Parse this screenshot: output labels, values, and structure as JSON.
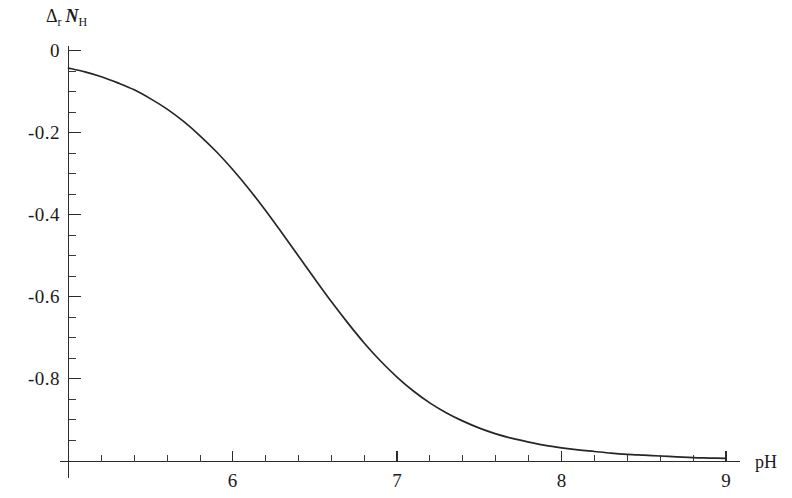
{
  "chart_data": {
    "type": "line",
    "title": "",
    "subtitle": "",
    "xlabel": "pH",
    "ylabel_parts": {
      "delta": "Δ",
      "delta_sub": "r",
      "symbol": "N",
      "symbol_sub": "H"
    },
    "ylabel": "Δr NH",
    "xlim": [
      5,
      9
    ],
    "ylim": [
      -1.0,
      0.0
    ],
    "x_major_ticks": [
      6,
      7,
      8,
      9
    ],
    "x_major_tick_labels": [
      "6",
      "7",
      "8",
      "9"
    ],
    "x_minor_tick_step": 0.2,
    "y_major_ticks": [
      0,
      -0.2,
      -0.4,
      -0.6,
      -0.8
    ],
    "y_major_tick_labels": [
      "0",
      "-0.2",
      "-0.4",
      "-0.6",
      "-0.8"
    ],
    "y_minor_tick_step": 0.05,
    "grid": false,
    "legend": null,
    "legend_position": "none",
    "line_color": "#262626",
    "axis_color": "#2b2b2b",
    "background_color": "#ffffff",
    "series": [
      {
        "name": "Δr NH vs pH",
        "x": [
          5.0,
          5.1,
          5.2,
          5.3,
          5.4,
          5.5,
          5.6,
          5.7,
          5.8,
          5.9,
          6.0,
          6.1,
          6.2,
          6.3,
          6.4,
          6.5,
          6.6,
          6.7,
          6.8,
          6.9,
          7.0,
          7.1,
          7.2,
          7.3,
          7.4,
          7.5,
          7.6,
          7.7,
          7.8,
          7.9,
          8.0,
          8.1,
          8.2,
          8.3,
          8.4,
          8.5,
          8.6,
          8.7,
          8.8,
          8.9,
          9.0
        ],
        "y": [
          -0.043,
          -0.052,
          -0.064,
          -0.079,
          -0.096,
          -0.118,
          -0.143,
          -0.173,
          -0.208,
          -0.247,
          -0.291,
          -0.339,
          -0.391,
          -0.446,
          -0.502,
          -0.558,
          -0.613,
          -0.665,
          -0.714,
          -0.758,
          -0.797,
          -0.831,
          -0.86,
          -0.884,
          -0.904,
          -0.921,
          -0.935,
          -0.946,
          -0.955,
          -0.963,
          -0.969,
          -0.974,
          -0.978,
          -0.982,
          -0.985,
          -0.987,
          -0.989,
          -0.991,
          -0.993,
          -0.994,
          -0.995
        ]
      }
    ]
  },
  "axis_labels": {
    "y_axis_title_delta": "Δ",
    "y_axis_title_delta_sub": "r",
    "y_axis_title_n": "N",
    "y_axis_title_n_sub": "H",
    "x_axis_title": "pH"
  }
}
